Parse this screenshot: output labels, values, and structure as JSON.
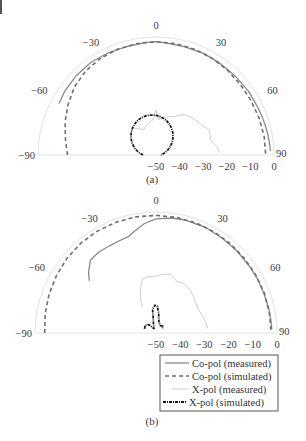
{
  "chart_data": [
    {
      "type": "polar",
      "subtitle": "(a)",
      "angle_range": [
        -90,
        90
      ],
      "angle_ticks": [
        -90,
        -60,
        -30,
        0,
        30,
        60,
        90
      ],
      "radial_ticks": [
        -50,
        -40,
        -30,
        -20,
        -10,
        0
      ],
      "radial_unit": "dB",
      "rlim": [
        -50,
        0
      ],
      "series": [
        {
          "name": "Co-pol (measured)",
          "style": "solid-gray",
          "angles": [
            -62,
            -55,
            -45,
            -35,
            -25,
            -15,
            -5,
            0,
            5,
            15,
            25,
            35,
            45,
            55,
            60,
            65,
            70,
            75,
            80,
            85,
            88
          ],
          "values": [
            -3.5,
            -2.8,
            -2.3,
            -2.0,
            -2.2,
            -2.4,
            -2.1,
            -2.0,
            -2.3,
            -2.6,
            -2.5,
            -2.6,
            -2.6,
            -2.4,
            -2.5,
            -2.4,
            -2.2,
            -2.0,
            -1.8,
            -1.6,
            -1.5
          ]
        },
        {
          "name": "Co-pol (simulated)",
          "style": "dashed-gray",
          "angles": [
            -90,
            -80,
            -70,
            -60,
            -50,
            -40,
            -30,
            -20,
            -10,
            0,
            10,
            20,
            30,
            40,
            50,
            60,
            70,
            80,
            90
          ],
          "values": [
            -12.5,
            -11.0,
            -9.0,
            -7.0,
            -5.0,
            -3.6,
            -2.8,
            -2.3,
            -2.1,
            -2.0,
            -2.1,
            -2.3,
            -2.6,
            -3.0,
            -3.4,
            -3.6,
            -3.6,
            -3.5,
            -3.5
          ]
        },
        {
          "name": "X-pol (measured)",
          "style": "solid-light",
          "angles": [
            -40,
            -32,
            -25,
            -18,
            -12,
            -5,
            0,
            4,
            10,
            18,
            25,
            35,
            45,
            55,
            65,
            75,
            82,
            88
          ],
          "values": [
            -35,
            -37,
            -38,
            -37,
            -36,
            -35,
            -31,
            -35,
            -34,
            -33,
            -32,
            -29,
            -28,
            -27,
            -25,
            -26,
            -24,
            -23
          ]
        },
        {
          "name": "X-pol (simulated)",
          "style": "dashdot-black",
          "angles": [
            -20,
            -15,
            -10,
            -5,
            0,
            5,
            10,
            15,
            20
          ],
          "values": [
            -36.5,
            -35.5,
            -34.7,
            -34.2,
            -34.0,
            -34.2,
            -34.7,
            -35.5,
            -36.5
          ],
          "circle": {
            "cx_db": -50,
            "note": "near-circle centered below origin, r approx 16 dB"
          }
        }
      ]
    },
    {
      "type": "polar",
      "subtitle": "(b)",
      "angle_range": [
        -90,
        90
      ],
      "angle_ticks": [
        -90,
        -60,
        -30,
        0,
        30,
        60,
        90
      ],
      "radial_ticks": [
        -50,
        -40,
        -30,
        -20,
        -10,
        0
      ],
      "radial_unit": "dB",
      "rlim": [
        -50,
        0
      ],
      "series": [
        {
          "name": "Co-pol (measured)",
          "style": "solid-gray",
          "angles": [
            -52,
            -48,
            -42,
            -35,
            -28,
            -22,
            -16,
            -12,
            -6,
            0,
            8,
            15,
            25,
            35,
            45,
            55,
            62,
            70,
            78,
            84,
            88
          ],
          "values": [
            -15.0,
            -12.5,
            -9.5,
            -9.0,
            -9.2,
            -9.0,
            -8.6,
            -7.0,
            -4.5,
            -2.8,
            -2.0,
            -1.8,
            -1.8,
            -2.2,
            -2.4,
            -2.6,
            -2.5,
            -2.5,
            -2.3,
            -2.2,
            -2.1
          ]
        },
        {
          "name": "Co-pol (simulated)",
          "style": "dashed-gray",
          "angles": [
            -90,
            -80,
            -70,
            -60,
            -50,
            -40,
            -30,
            -20,
            -10,
            0,
            10,
            20,
            30,
            40,
            50,
            60,
            70,
            80,
            90
          ],
          "values": [
            -4.0,
            -3.5,
            -3.0,
            -2.5,
            -2.0,
            -1.6,
            -1.4,
            -1.3,
            -1.3,
            -1.4,
            -1.5,
            -1.6,
            -1.8,
            -2.0,
            -2.2,
            -2.3,
            -2.3,
            -2.4,
            -2.4
          ]
        },
        {
          "name": "X-pol (measured)",
          "style": "solid-light",
          "angles": [
            -28,
            -25,
            -20,
            -14,
            -8,
            -3,
            0,
            4,
            8,
            14,
            22,
            30,
            40,
            50,
            60,
            70,
            78,
            85
          ],
          "values": [
            -38,
            -35,
            -31,
            -27,
            -26.5,
            -26.5,
            -26.5,
            -26,
            -25.5,
            -25,
            -27,
            -26.5,
            -27.5,
            -29,
            -30,
            -29.5,
            -29,
            -28.5
          ]
        },
        {
          "name": "X-pol (simulated)",
          "style": "dashdot-black",
          "angles": [
            -70,
            -55,
            -40,
            -25,
            -15,
            -8,
            -2,
            3,
            8,
            14,
            30,
            45,
            60
          ],
          "values": [
            -45,
            -44.5,
            -45.5,
            -48,
            -46,
            -40,
            -38.5,
            -39,
            -42,
            -45,
            -46.5,
            -46,
            -47
          ],
          "note": "small lobes clustered around the center"
        }
      ],
      "legend": {
        "position": "lower-right",
        "entries": [
          "Co-pol (measured)",
          "Co-pol (simulated)",
          "X-pol (measured)",
          "X-pol (simulated)"
        ]
      }
    }
  ],
  "figure": {
    "charts": [
      {
        "id": "a",
        "subtitle": "(a)",
        "cx": 156,
        "cy": 155,
        "R": 118
      },
      {
        "id": "b",
        "subtitle": "(b)",
        "cx": 156,
        "cy": 333,
        "R": 121
      }
    ],
    "colors": {
      "copol_measured": "#8a8a8a",
      "copol_simulated": "#6e6e6e",
      "xpol_measured": "#c8c8c8",
      "xpol_simulated": "#1a1a1a",
      "grid": "#e2e2e2",
      "text": "#3a3a3a"
    }
  },
  "legend": {
    "entries": [
      {
        "label": "Co-pol (measured)"
      },
      {
        "label": "Co-pol (simulated)"
      },
      {
        "label": "X-pol (measured)"
      },
      {
        "label": "X-pol (simulated)"
      }
    ]
  }
}
